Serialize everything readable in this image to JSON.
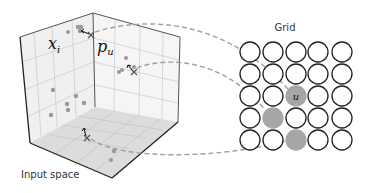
{
  "labels": {
    "input_space": "Input space",
    "grid": "Grid",
    "x_i": "x",
    "x_i_sub": "i",
    "p_u": "p",
    "p_u_sub": "u",
    "unit_label": "u"
  },
  "grid": {
    "rows": 5,
    "cols": 5,
    "filled_cells": [
      [
        2,
        2
      ],
      [
        3,
        1
      ],
      [
        4,
        2
      ]
    ],
    "labeled_cell": [
      2,
      2
    ]
  },
  "colors": {
    "filled": "#a6a6a6",
    "outline": "#222222",
    "dashed": "#a0a0a0",
    "cube_face": "#f2f2f2",
    "cube_floor": "#dedede",
    "grid_line": "#c8c8c8"
  }
}
